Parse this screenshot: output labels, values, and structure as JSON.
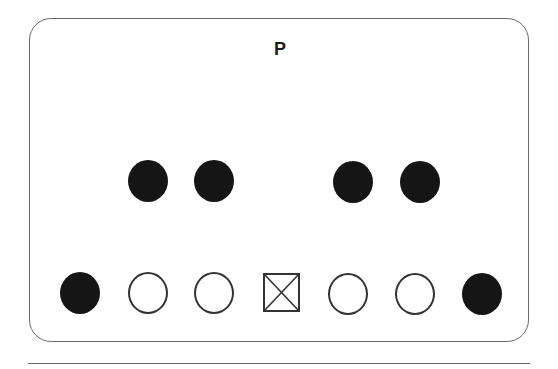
{
  "diagram": {
    "title_label": "P",
    "colors": {
      "frame": "#6a6a6a",
      "filled": "#151515",
      "open_stroke": "#333333",
      "background": "#ffffff"
    },
    "backfield": [
      {
        "id": "back-1",
        "shape": "filled-circle",
        "x": 128,
        "y": 160
      },
      {
        "id": "back-2",
        "shape": "filled-circle",
        "x": 194,
        "y": 160
      },
      {
        "id": "back-3",
        "shape": "filled-circle",
        "x": 333,
        "y": 161
      },
      {
        "id": "back-4",
        "shape": "filled-circle",
        "x": 400,
        "y": 161
      }
    ],
    "line": [
      {
        "id": "left-end",
        "shape": "filled-circle",
        "x": 60,
        "y": 272
      },
      {
        "id": "left-tackle",
        "shape": "open-circle",
        "x": 128,
        "y": 272
      },
      {
        "id": "left-guard",
        "shape": "open-circle",
        "x": 194,
        "y": 272
      },
      {
        "id": "center",
        "shape": "x-square",
        "x": 263,
        "y": 273
      },
      {
        "id": "right-guard",
        "shape": "open-circle",
        "x": 328,
        "y": 273
      },
      {
        "id": "right-tackle",
        "shape": "open-circle",
        "x": 395,
        "y": 273
      },
      {
        "id": "right-end",
        "shape": "filled-circle",
        "x": 462,
        "y": 273
      }
    ]
  }
}
